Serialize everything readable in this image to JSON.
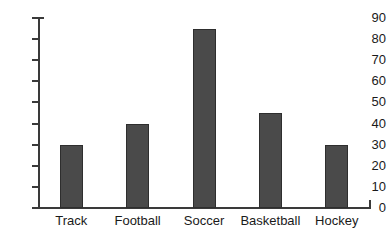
{
  "chart_data": {
    "type": "bar",
    "title": "",
    "subtitle": "",
    "xlabel": "",
    "ylabel": "",
    "categories": [
      "Track",
      "Football",
      "Soccer",
      "Basketball",
      "Hockey"
    ],
    "values": [
      30,
      40,
      85,
      45,
      30
    ],
    "ylim": [
      0,
      90
    ],
    "ytick_step": 10,
    "yticks": [
      0,
      10,
      20,
      30,
      40,
      50,
      60,
      70,
      80,
      90
    ],
    "ytick_labels": [
      "0",
      "10",
      "20",
      "30",
      "40",
      "50",
      "60",
      "70",
      "80",
      "90"
    ],
    "grid": false,
    "legend": false,
    "legend_position": "none",
    "annotations": [],
    "colors": {
      "bar_fill": "#4a4a4a",
      "bar_stroke": "#2e2e2e",
      "axis": "#3a3a3a",
      "text": "#1a1a1a",
      "background": "#ffffff"
    }
  }
}
